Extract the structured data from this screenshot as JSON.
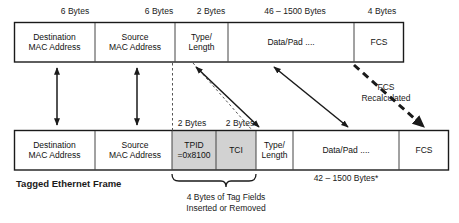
{
  "diagram": {
    "title_label": "Tagged Ethernet Frame",
    "untagged_frame": {
      "size_labels": [
        {
          "text": "6 Bytes"
        },
        {
          "text": "6 Bytes"
        },
        {
          "text": "2 Bytes"
        },
        {
          "text": "46 – 1500 Bytes"
        },
        {
          "text": "4 Bytes"
        }
      ],
      "fields": [
        {
          "line1": "Destination",
          "line2": "MAC Address"
        },
        {
          "line1": "Source",
          "line2": "MAC Address"
        },
        {
          "line1": "Type/",
          "line2": "Length"
        },
        {
          "line1": "Data/Pad ....",
          "line2": ""
        },
        {
          "line1": "FCS",
          "line2": ""
        }
      ]
    },
    "tagged_frame": {
      "size_labels": [
        {
          "text": "2 Bytes"
        },
        {
          "text": "2 Bytes"
        }
      ],
      "payload_size_label": "42 – 1500 Bytes*",
      "fields": [
        {
          "line1": "Destination",
          "line2": "MAC Address"
        },
        {
          "line1": "TPID",
          "line2": "=0x8100"
        },
        {
          "line1": "TCI",
          "line2": ""
        },
        {
          "line1": "Type/",
          "line2": "Length"
        },
        {
          "line1": "Data/Pad ....",
          "line2": ""
        },
        {
          "line1": "FCS",
          "line2": ""
        }
      ],
      "source_field": {
        "line1": "Source",
        "line2": "MAC Address"
      }
    },
    "annotations": {
      "fcs_recalculated_line1": "FCS",
      "fcs_recalculated_line2": "Recalculated",
      "tag_brace_line1": "4 Bytes of Tag Fields",
      "tag_brace_line2": "Inserted or Removed"
    },
    "colors": {
      "stroke": "#1a1a1a",
      "shade": "#d2d2d2",
      "background": "#ffffff"
    }
  }
}
